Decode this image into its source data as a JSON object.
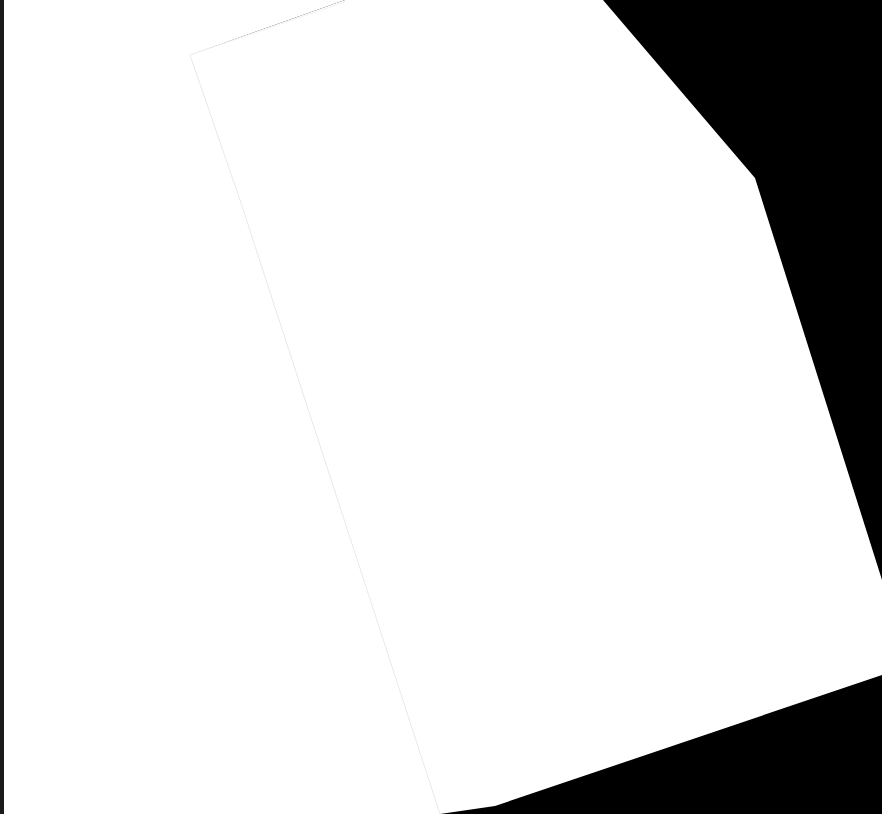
{
  "scene": {
    "description": "Two overlapping blank white paper sheets on a black background",
    "background_color": "#000000",
    "sheets": [
      {
        "name": "back-sheet",
        "color": "#ffffff",
        "points": "0,0 345,0 190,55 240,200 440,814 0,814"
      },
      {
        "name": "front-sheet",
        "color": "#ffffff",
        "points": "190,55 345,0 603,0 755,178 882,580 882,675 495,806 440,814 240,200"
      }
    ],
    "edge_line_color": "#f2f2f2"
  }
}
